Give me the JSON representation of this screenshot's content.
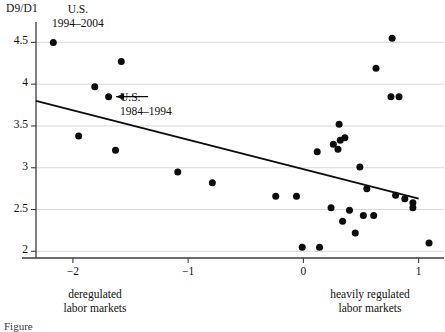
{
  "chart_data": {
    "type": "scatter",
    "title": "",
    "ylabel": "D9/D1",
    "xlabel": "",
    "xlim": [
      -2.32,
      1.22
    ],
    "ylim": [
      1.92,
      4.72
    ],
    "grid": true,
    "legend": "none",
    "yticks": [
      2,
      2.5,
      3,
      3.5,
      4,
      4.5
    ],
    "ytick_labels": [
      "2",
      "2.5",
      "3",
      "3.5",
      "4",
      "4.5"
    ],
    "xticks": [
      -2,
      -1,
      0,
      1
    ],
    "xtick_labels": [
      "−2",
      "−1",
      "0",
      "1"
    ],
    "x_axis_left_caption": "deregulated\nlabor markets",
    "x_axis_right_caption": "heavily regulated\nlabor markets",
    "points": [
      {
        "x": -2.17,
        "y": 4.5
      },
      {
        "x": -1.58,
        "y": 4.27
      },
      {
        "x": -1.81,
        "y": 3.97
      },
      {
        "x": -1.69,
        "y": 3.85
      },
      {
        "x": -1.95,
        "y": 3.38
      },
      {
        "x": -1.63,
        "y": 3.21
      },
      {
        "x": -1.09,
        "y": 2.95
      },
      {
        "x": -0.79,
        "y": 2.82
      },
      {
        "x": -0.24,
        "y": 2.66
      },
      {
        "x": -0.06,
        "y": 2.66
      },
      {
        "x": -0.01,
        "y": 2.05
      },
      {
        "x": 0.14,
        "y": 2.05
      },
      {
        "x": 0.12,
        "y": 3.19
      },
      {
        "x": 0.24,
        "y": 2.52
      },
      {
        "x": 0.26,
        "y": 3.28
      },
      {
        "x": 0.3,
        "y": 3.22
      },
      {
        "x": 0.31,
        "y": 3.52
      },
      {
        "x": 0.32,
        "y": 3.33
      },
      {
        "x": 0.34,
        "y": 2.36
      },
      {
        "x": 0.36,
        "y": 3.36
      },
      {
        "x": 0.4,
        "y": 2.49
      },
      {
        "x": 0.45,
        "y": 2.22
      },
      {
        "x": 0.49,
        "y": 3.01
      },
      {
        "x": 0.52,
        "y": 2.43
      },
      {
        "x": 0.55,
        "y": 2.75
      },
      {
        "x": 0.61,
        "y": 2.43
      },
      {
        "x": 0.63,
        "y": 4.19
      },
      {
        "x": 0.77,
        "y": 4.55
      },
      {
        "x": 0.8,
        "y": 2.67
      },
      {
        "x": 0.88,
        "y": 2.63
      },
      {
        "x": 0.76,
        "y": 3.85
      },
      {
        "x": 0.83,
        "y": 3.85
      },
      {
        "x": 0.95,
        "y": 2.58
      },
      {
        "x": 0.95,
        "y": 2.52
      },
      {
        "x": 1.09,
        "y": 2.1
      }
    ],
    "trend_line": {
      "x0": -2.32,
      "y0": 3.8,
      "x1": 1.0,
      "y1": 2.63
    },
    "annotations": [
      {
        "name": "us-1994-2004",
        "line1": "U.S.",
        "line2": "1994–2004",
        "target_x": -2.17,
        "target_y": 4.5
      },
      {
        "name": "us-1984-1994",
        "line1": "U.S.",
        "line2": "1984–1994",
        "target_x": -1.69,
        "target_y": 3.85,
        "arrow": true
      }
    ]
  },
  "figure": {
    "caption_partial": "Figure"
  }
}
